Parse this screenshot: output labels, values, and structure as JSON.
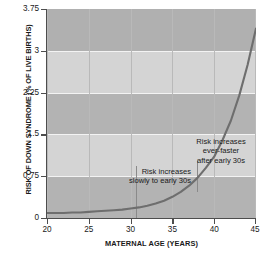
{
  "chart_data": {
    "type": "line",
    "title": "",
    "xlabel": "MATERNAL AGE (YEARS)",
    "ylabel": "RISK OF DOWN SYNDROME (% OF LIVE BIRTHS)",
    "xlim": [
      20,
      45
    ],
    "ylim": [
      0,
      3.75
    ],
    "xticks": [
      20,
      25,
      30,
      35,
      40,
      45
    ],
    "xtick_labels": [
      "20",
      "25",
      "30",
      "35",
      "40",
      "45"
    ],
    "yticks": [
      0,
      0.75,
      1.5,
      2.25,
      3,
      3.75
    ],
    "ytick_labels": [
      "0",
      "0.75",
      "1.5",
      "2.25",
      "3",
      "3.75"
    ],
    "grid": "vertical gridlines at x ticks; alternating horizontal shaded bands every 0.75 units",
    "legend": "none",
    "series": [
      {
        "name": "Risk of Down syndrome",
        "x": [
          20,
          21,
          22,
          23,
          24,
          25,
          26,
          27,
          28,
          29,
          30,
          31,
          32,
          33,
          34,
          35,
          36,
          37,
          38,
          39,
          40,
          41,
          42,
          43,
          44,
          45
        ],
        "values": [
          0.09,
          0.09,
          0.09,
          0.1,
          0.1,
          0.11,
          0.12,
          0.13,
          0.14,
          0.15,
          0.17,
          0.19,
          0.22,
          0.26,
          0.31,
          0.38,
          0.47,
          0.58,
          0.72,
          0.9,
          1.1,
          1.4,
          1.75,
          2.2,
          2.75,
          3.4
        ]
      }
    ],
    "annotations": [
      {
        "text": "Risk increases\nslowly to early 30s",
        "leader_from_x": 30.6,
        "leader_from_y": 0.93,
        "leader_to_y": 0.1
      },
      {
        "text": "Risk increases\never-faster\nafter early 30s",
        "leader_from_x": 37.9,
        "leader_from_y": 1.05,
        "leader_to_y": 0.63
      }
    ],
    "colors": {
      "curve": "#6e6e6e",
      "band_dark": "#b0b0b0",
      "band_light": "#d2d2d2",
      "gridline": "#b9b9b9",
      "axis": "#4d4d4d",
      "text": "#1a1a1a",
      "background": "#ffffff"
    }
  }
}
